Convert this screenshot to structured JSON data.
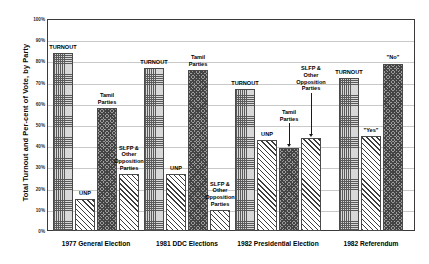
{
  "chart_data": {
    "type": "bar",
    "title": "",
    "xlabel": "",
    "ylabel": "Total Turnout and Per-cent of Vote, by Party",
    "ylim": [
      0,
      100
    ],
    "ytick_labels": [
      "100%",
      "90%",
      "80%",
      "70%",
      "60%",
      "50%",
      "40%",
      "30%",
      "20%",
      "10%",
      "0%"
    ],
    "ytick_values": [
      100,
      90,
      80,
      70,
      60,
      50,
      40,
      30,
      20,
      10,
      0
    ],
    "grid": true,
    "legend": "none",
    "categories": [
      "1977 General Election",
      "1981 DDC Elections",
      "1982 Presidential Election",
      "1982 Referendum"
    ],
    "groups": [
      {
        "category": "1977 General Election",
        "bars": [
          {
            "label": "TURNOUT",
            "value": 84,
            "pattern": "grid",
            "callout": false
          },
          {
            "label": "UNP",
            "value": 15,
            "pattern": "hatch",
            "callout": false
          },
          {
            "label": "Tamil\nParties",
            "value": 58,
            "pattern": "check",
            "callout": false
          },
          {
            "label": "SLFP &\nOther\nOpposition\nParties",
            "value": 27,
            "pattern": "hatch",
            "callout": false
          }
        ]
      },
      {
        "category": "1981 DDC Elections",
        "bars": [
          {
            "label": "TURNOUT",
            "value": 77,
            "pattern": "grid",
            "callout": false
          },
          {
            "label": "UNP",
            "value": 27,
            "pattern": "hatch",
            "callout": false
          },
          {
            "label": "Tamil\nParties",
            "value": 76,
            "pattern": "check",
            "callout": false
          },
          {
            "label": "SLFP &\nOther\nOpposition\nParties",
            "value": 10,
            "pattern": "hatch",
            "callout": false
          }
        ]
      },
      {
        "category": "1982 Presidential Election",
        "bars": [
          {
            "label": "TURNOUT",
            "value": 67,
            "pattern": "grid",
            "callout": false
          },
          {
            "label": "UNP",
            "value": 43,
            "pattern": "hatch",
            "callout": false
          },
          {
            "label": "Tamil\nParties",
            "value": 39,
            "pattern": "check",
            "callout": true
          },
          {
            "label": "SLFP &\nOther\nOpposition\nParties",
            "value": 44,
            "pattern": "hatch",
            "callout": true
          }
        ]
      },
      {
        "category": "1982 Referendum",
        "bars": [
          {
            "label": "TURNOUT",
            "value": 72,
            "pattern": "grid",
            "callout": false
          },
          {
            "label": "\"Yes\"",
            "value": 45,
            "pattern": "hatch",
            "callout": false
          },
          {
            "label": "\"No\"",
            "value": 79,
            "pattern": "check",
            "callout": false
          }
        ]
      }
    ],
    "colors": {
      "frame": "#3a3a3a",
      "gridline": "#c9c9c9",
      "bar_outline": "#4a4a4a",
      "text": "#000000"
    }
  }
}
